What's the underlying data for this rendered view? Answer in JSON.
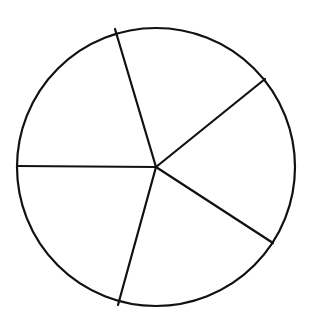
{
  "diagram": {
    "type": "circle-divided-into-sectors",
    "background_color": "#ffffff",
    "stroke_color": "#111111",
    "stroke_width": 2.2,
    "circle": {
      "cx": 156,
      "cy": 167,
      "r": 139
    },
    "sector_count": 5,
    "radial_lines": [
      {
        "name": "radius-top",
        "x2": 115,
        "y2": 29
      },
      {
        "name": "radius-upper-right",
        "x2": 265,
        "y2": 79
      },
      {
        "name": "radius-lower-right",
        "x2": 273,
        "y2": 243
      },
      {
        "name": "radius-bottom",
        "x2": 118,
        "y2": 305
      },
      {
        "name": "radius-left",
        "x2": 17,
        "y2": 166
      }
    ],
    "sectors": [
      {
        "name": "sector-top-right",
        "approx_angle_deg": 72
      },
      {
        "name": "sector-top-left",
        "approx_angle_deg": 72
      },
      {
        "name": "sector-bottom-left",
        "approx_angle_deg": 72
      },
      {
        "name": "sector-bottom",
        "approx_angle_deg": 72
      },
      {
        "name": "sector-right",
        "approx_angle_deg": 72
      }
    ]
  }
}
